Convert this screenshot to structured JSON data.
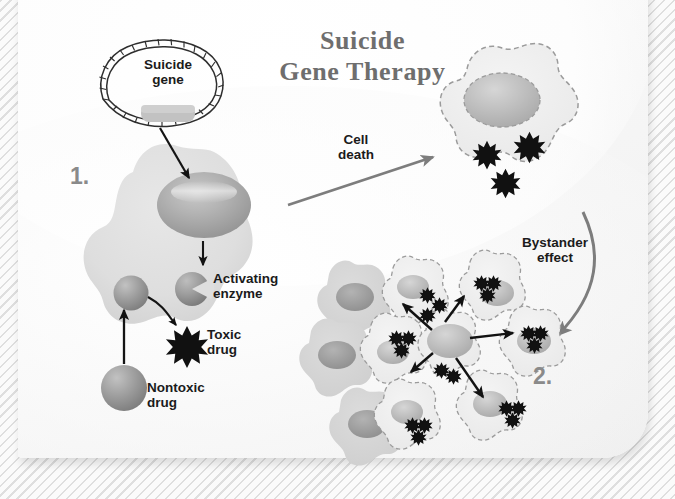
{
  "figure": {
    "title": "Suicide\nGene Therapy",
    "domain_kind": "biology-diagram"
  },
  "steps": [
    {
      "name": "step-one",
      "number": "1."
    },
    {
      "name": "step-two",
      "number": "2."
    }
  ],
  "labels": {
    "suicide_gene": "Suicide\ngene",
    "activating_enzyme": "Activating\nenzyme",
    "toxic_drug": "Toxic\ndrug",
    "nontoxic_drug": "Nontoxic\ndrug",
    "cell_death": "Cell\ndeath",
    "bystander_effect": "Bystander\neffect"
  },
  "colors": {
    "title_gray": "#6e6e6e",
    "step_number_gray": "#8a8a8a",
    "label_black": "#1b1b1b",
    "cell_fill": "#e0e0e0",
    "cell_fill_light": "#efefef",
    "nucleus_dark": "#9a9a9a",
    "nucleus_light": "#c6c6c6",
    "toxic_drug_black": "#111111",
    "gray_arrow": "#7d7d7d",
    "black_arrow": "#121212",
    "dashed_outline": "#9b9b9b",
    "card_bg": "#f6f6f6",
    "page_bg": "#fbfbfb"
  },
  "elements": {
    "plasmid": {
      "name": "suicide-gene-plasmid",
      "insert_shape": "rounded-rect"
    },
    "transfected_cell": {
      "name": "transfected-cancer-cell",
      "outline": "solid"
    },
    "dying_cell": {
      "name": "dying-cell",
      "outline": "dashed",
      "toxic_drug_count": 3
    },
    "bystander_cluster": {
      "name": "bystander-cell-cluster",
      "healthy_cells": 3,
      "dying_cells": 7,
      "arrows": 5,
      "toxic_drug_per_cell": 3
    }
  }
}
